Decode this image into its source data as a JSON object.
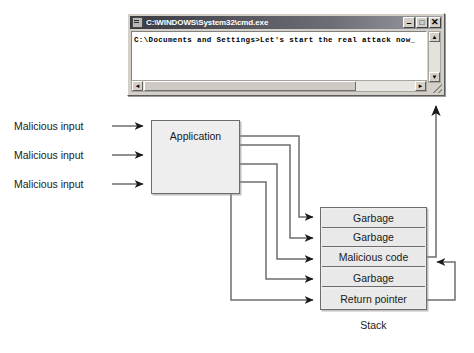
{
  "diagram": {
    "stroke_color": "#6d6d6d",
    "arrow_color": "#1a1a1a",
    "box_fill": "#eeeeee"
  },
  "cmd_window": {
    "title": "C:\\WINDOWS\\System32\\cmd.exe",
    "icon": "cmd-window-icon",
    "console_text": "C:\\Documents and Settings>Let's start the real attack now_",
    "controls": {
      "minimize": "–",
      "maximize": "□",
      "close": "✕"
    },
    "scroll": {
      "up": "▲",
      "down": "▼",
      "left": "◄",
      "right": "►"
    }
  },
  "inputs": {
    "labels": [
      "Malicious input",
      "Malicious input",
      "Malicious input"
    ]
  },
  "application": {
    "label": "Application"
  },
  "stack": {
    "caption": "Stack",
    "rows": [
      "Garbage",
      "Garbage",
      "Malicious code",
      "Garbage",
      "Return pointer"
    ]
  }
}
